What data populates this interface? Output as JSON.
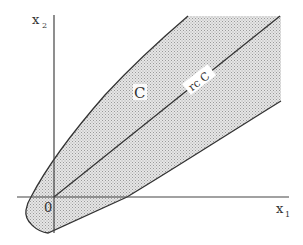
{
  "diagram": {
    "axes": {
      "x_label": "x",
      "x_label_sub": "1",
      "y_label": "x",
      "y_label_sub": "2",
      "origin_label": "0"
    },
    "region": {
      "label": "C",
      "fill": "stippled-gray"
    },
    "recession_cone": {
      "label": "rc C"
    },
    "colors": {
      "line": "#333333",
      "fill": "#d4d4d4",
      "background": "#ffffff"
    }
  }
}
